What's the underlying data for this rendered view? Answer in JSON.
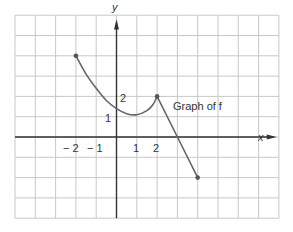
{
  "chart_data": {
    "type": "line",
    "title": "",
    "xlabel": "x",
    "ylabel": "y",
    "annotation": "Graph of f",
    "x_tick_labels": [
      "−2",
      "−1",
      "1",
      "2"
    ],
    "x_ticks": [
      -2,
      -1,
      1,
      2
    ],
    "y_tick_labels": [
      "1",
      "2"
    ],
    "y_ticks": [
      1,
      2
    ],
    "xlim": [
      -5,
      8
    ],
    "ylim": [
      -4,
      6
    ],
    "grid": true,
    "series": [
      {
        "name": "f",
        "segments": [
          {
            "kind": "curve",
            "points": [
              [
                -2,
                4
              ],
              [
                -1.5,
                3.1
              ],
              [
                -1,
                2.4
              ],
              [
                -0.5,
                1.8
              ],
              [
                0,
                1.4
              ],
              [
                0.5,
                1.15
              ],
              [
                1,
                1.1
              ],
              [
                1.5,
                1.3
              ],
              [
                1.8,
                1.6
              ],
              [
                2,
                2
              ]
            ]
          },
          {
            "kind": "line",
            "points": [
              [
                2,
                2
              ],
              [
                3,
                0
              ],
              [
                4,
                -2
              ]
            ]
          }
        ],
        "endpoints": [
          [
            -2,
            4
          ],
          [
            4,
            -2
          ]
        ],
        "marked_points": [
          [
            -2,
            4
          ],
          [
            2,
            2
          ],
          [
            4,
            -2
          ]
        ]
      }
    ]
  },
  "labels": {
    "x_axis": "x",
    "y_axis": "y",
    "graph_caption": "Graph of f",
    "x_neg2": "− 2",
    "x_neg1": "− 1",
    "x_1": "1",
    "x_2": "2",
    "y_1": "1",
    "y_2": "2"
  },
  "colors": {
    "grid": "#c8c8c8",
    "axis": "#333333",
    "curve": "#666666",
    "point": "#555555"
  }
}
